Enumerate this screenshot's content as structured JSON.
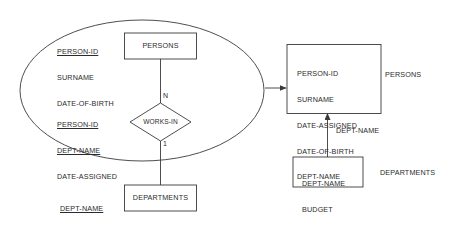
{
  "diagram": {
    "stroke_color": "#3a3a3a",
    "text_color": "#2b2b2b",
    "background_color": "#ffffff"
  },
  "er_model": {
    "ellipse_name": "er-model-boundary",
    "entities": [
      {
        "name": "persons-entity",
        "label": "PERSONS",
        "attributes": [
          {
            "text": "PERSON-ID",
            "key": true
          },
          {
            "text": "SURNAME",
            "key": false
          },
          {
            "text": "DATE-OF-BIRTH",
            "key": false
          }
        ]
      },
      {
        "name": "departments-entity",
        "label": "DEPARTMENTS",
        "attributes": [
          {
            "text": "DEPT-NAME",
            "key": true
          },
          {
            "text": "BUDGET",
            "key": false
          }
        ]
      }
    ],
    "relationship": {
      "name": "works-in-relationship",
      "label": "WORKS-IN",
      "attributes": [
        {
          "text": "PERSON-ID",
          "key": true
        },
        {
          "text": "DEPT-NAME",
          "key": true
        },
        {
          "text": "DATE-ASSIGNED",
          "key": false
        }
      ],
      "cardinality_top": "N",
      "cardinality_bottom": "1"
    }
  },
  "relational_model": {
    "tables": [
      {
        "name": "persons-table",
        "caption": "PERSONS",
        "columns": [
          "PERSON-ID",
          "SURNAME",
          "DATE-ASSIGNED",
          "DATE-OF-BIRTH",
          "DEPT-NAME"
        ]
      },
      {
        "name": "departments-table",
        "caption": "DEPARTMENTS",
        "columns": [
          "DEPT-NAME",
          "BUDGET"
        ]
      }
    ],
    "foreign_key_label": "DEPT-NAME"
  }
}
